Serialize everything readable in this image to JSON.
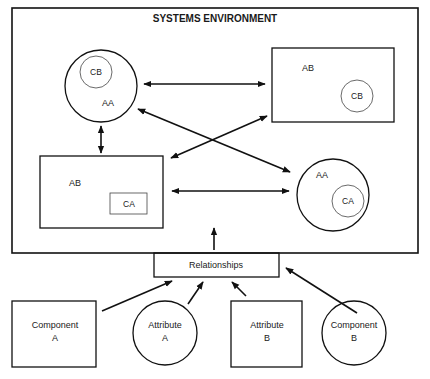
{
  "diagram": {
    "title": "SYSTEMS ENVIRONMENT",
    "environment": {
      "top_left_circle": {
        "label": "AA",
        "inner_label": "CB"
      },
      "top_right_rect": {
        "label": "AB",
        "inner_label": "CB"
      },
      "bottom_left_rect": {
        "label": "AB",
        "inner_label": "CA"
      },
      "bottom_right_circle": {
        "label": "AA",
        "inner_label": "CA"
      }
    },
    "relationships": {
      "label": "Relationships"
    },
    "inputs": [
      {
        "line1": "Component",
        "line2": "A",
        "shape": "rectangle"
      },
      {
        "line1": "Attribute",
        "line2": "A",
        "shape": "circle"
      },
      {
        "line1": "Attribute",
        "line2": "B",
        "shape": "rectangle"
      },
      {
        "line1": "Component",
        "line2": "B",
        "shape": "circle"
      }
    ],
    "connections": [
      {
        "from": "top_left_circle",
        "to": "top_right_rect",
        "type": "bidirectional"
      },
      {
        "from": "top_left_circle",
        "to": "bottom_left_rect",
        "type": "bidirectional"
      },
      {
        "from": "top_left_circle",
        "to": "bottom_right_circle",
        "type": "bidirectional"
      },
      {
        "from": "top_right_rect",
        "to": "bottom_left_rect",
        "type": "bidirectional"
      },
      {
        "from": "bottom_left_rect",
        "to": "bottom_right_circle",
        "type": "bidirectional"
      },
      {
        "from": "relationships",
        "to": "systems_environment",
        "type": "directed"
      },
      {
        "from": "Component A",
        "to": "relationships",
        "type": "directed"
      },
      {
        "from": "Attribute A",
        "to": "relationships",
        "type": "directed"
      },
      {
        "from": "Attribute B",
        "to": "relationships",
        "type": "directed"
      },
      {
        "from": "Component B",
        "to": "relationships",
        "type": "directed"
      }
    ],
    "colors": {
      "line": "#111111",
      "background": "#ffffff"
    }
  }
}
